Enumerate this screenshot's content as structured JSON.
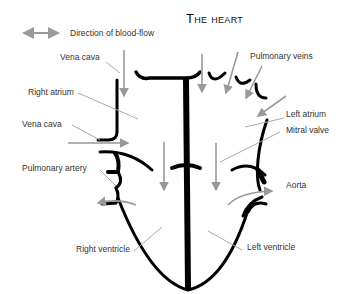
{
  "title": "The heart",
  "legend": {
    "label": "Direction of blood-flow",
    "arrow_color": "#999999"
  },
  "labels": {
    "vena_cava_top": "Vena cava",
    "right_atrium": "Right atrium",
    "vena_cava_left": "Vena cava",
    "pulmonary_artery": "Pulmonary artery",
    "right_ventricle": "Right ventricle",
    "pulmonary_veins": "Pulmonary veins",
    "left_atrium": "Left atrium",
    "mitral_valve": "Mitral valve",
    "aorta": "Aorta",
    "left_ventricle": "Left ventricle"
  },
  "colors": {
    "wall": "#000000",
    "flow_arrow": "#999999",
    "leader_line": "#aaaaaa"
  }
}
